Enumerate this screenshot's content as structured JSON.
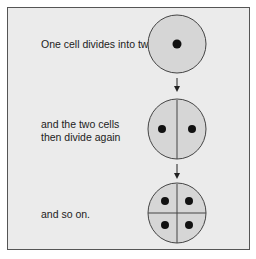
{
  "diagram": {
    "steps": [
      {
        "label": "One cell divides into two",
        "cells": 1
      },
      {
        "label_line1": "and the two cells",
        "label_line2": "then divide again",
        "cells": 2
      },
      {
        "label": "and so on.",
        "cells": 4
      }
    ],
    "colors": {
      "background": "#ebebeb",
      "cell_fill": "#d6d6d6",
      "outline": "#444444",
      "nucleus": "#111111"
    }
  }
}
